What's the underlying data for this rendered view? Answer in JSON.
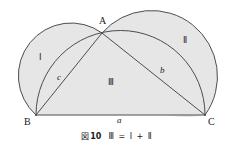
{
  "figure": {
    "caption": {
      "figure_word": "図",
      "number": "10",
      "equation": "Ⅲ = Ⅰ + Ⅱ"
    },
    "vertices": [
      {
        "name": "A",
        "label": "A",
        "x": 102,
        "y": 33
      },
      {
        "name": "B",
        "label": "B",
        "x": 36,
        "y": 115
      },
      {
        "name": "C",
        "label": "C",
        "x": 205,
        "y": 115
      }
    ],
    "sides": [
      {
        "name": "a",
        "label": "a",
        "from": "B",
        "to": "C"
      },
      {
        "name": "b",
        "label": "b",
        "from": "A",
        "to": "C"
      },
      {
        "name": "c",
        "label": "c",
        "from": "B",
        "to": "A"
      }
    ],
    "regions": [
      {
        "name": "lune-left",
        "label": "Ⅰ"
      },
      {
        "name": "lune-right",
        "label": "Ⅱ"
      },
      {
        "name": "triangle",
        "label": "Ⅲ"
      }
    ],
    "colors": {
      "fill": "#e6e6e6",
      "stroke": "#4d4d4d",
      "background": "#ffffff",
      "text": "#1a1a1a"
    }
  }
}
